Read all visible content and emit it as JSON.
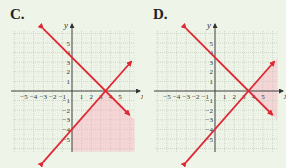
{
  "colors": {
    "background": "#eef4e8",
    "grid": "#b8c4b4",
    "axis": "#333333",
    "line": "#e02834",
    "shade": "#f7cfd2"
  },
  "chart_data": [
    {
      "type": "line",
      "label": "C.",
      "title": "C.",
      "xlabel": "x",
      "ylabel": "y",
      "xlim": [
        -6,
        6.5
      ],
      "ylim": [
        -6,
        6.5
      ],
      "x_ticks": [
        -5,
        -4,
        -3,
        -2,
        -1,
        1,
        2,
        3,
        4,
        5
      ],
      "y_ticks": [
        -5,
        -4,
        -3,
        -2,
        -1,
        1,
        2,
        3,
        4,
        5
      ],
      "grid": true,
      "series": [
        {
          "name": "line 1",
          "equation": "y = -x + 3.5",
          "points": [
            [
              -3,
              6.5
            ],
            [
              6,
              -2.5
            ]
          ]
        },
        {
          "name": "line 2",
          "equation": "y = 8/7 x - 4",
          "points": [
            [
              -3,
              -7.4
            ],
            [
              6.2,
              3.1
            ]
          ]
        }
      ],
      "shaded_region": "below both lines (lower right), x > 0"
    },
    {
      "type": "line",
      "label": "D.",
      "title": "D.",
      "xlabel": "x",
      "ylabel": "y",
      "xlim": [
        -6,
        6.5
      ],
      "ylim": [
        -6,
        6.5
      ],
      "x_ticks": [
        -5,
        -4,
        -3,
        -2,
        -1,
        1,
        2,
        3,
        4,
        5
      ],
      "y_ticks": [
        -5,
        -4,
        -3,
        -2,
        -1,
        1,
        2,
        3,
        4,
        5
      ],
      "grid": true,
      "series": [
        {
          "name": "line 1",
          "equation": "y = -x + 3.5",
          "points": [
            [
              -3,
              6.5
            ],
            [
              6,
              -2.5
            ]
          ]
        },
        {
          "name": "line 2",
          "equation": "y = 8/7 x - 4",
          "points": [
            [
              -3,
              -7.4
            ],
            [
              6.2,
              3.1
            ]
          ]
        }
      ],
      "shaded_region": "right of intersection, between lines"
    }
  ],
  "panels": [
    {
      "label": "C.",
      "x_tick_labels": [
        "-5",
        "-4",
        "-3",
        "-2",
        "-1",
        "1",
        "2",
        "3",
        "4",
        "5"
      ],
      "y_tick_labels": [
        "5",
        "4",
        "3",
        "2",
        "1",
        "-1",
        "-2",
        "-3",
        "-4",
        "-5"
      ],
      "xlabel": "x",
      "ylabel": "y"
    },
    {
      "label": "D.",
      "x_tick_labels": [
        "-5",
        "-4",
        "-3",
        "-2",
        "-1",
        "1",
        "2",
        "3",
        "4",
        "5"
      ],
      "y_tick_labels": [
        "5",
        "4",
        "3",
        "2",
        "1",
        "-1",
        "-2",
        "-3",
        "-4",
        "-5"
      ],
      "xlabel": "x",
      "ylabel": "y"
    }
  ]
}
